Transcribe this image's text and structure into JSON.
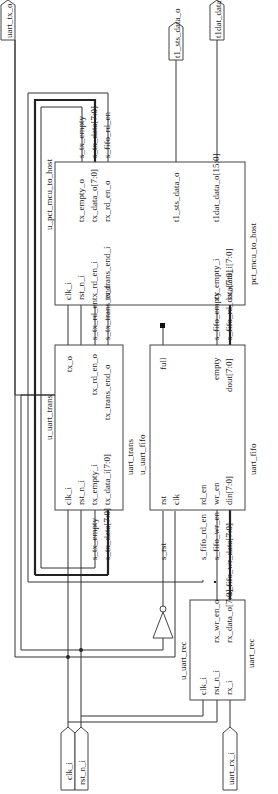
{
  "ports": {
    "clk_i": "clk_i",
    "rst_n_i": "rst_n_i",
    "uart_rx_i": "uart_rx_i",
    "uart_tx_o": "uart_tx_o",
    "t1_sts_data_o": "t1_sts_data_o",
    "t1dat_data_o": "t1dat_data_o[15:0]"
  },
  "blocks": {
    "mcu": {
      "inst": "u_pct_mcu_to_host",
      "type": "pct_mcu_to_host",
      "in": [
        "clk_i",
        "rst_n_i",
        "tx_rd_en_i",
        "tx_trans_end_i",
        "rx_empty_i",
        "rx_data_i[7:0]"
      ],
      "out": [
        "tx_empty_o",
        "tx_data_o[7:0]",
        "rx_rd_en_o",
        "t1_sts_data_o",
        "t1dat_data_o[15:0]"
      ]
    },
    "trans": {
      "inst": "u_uart_trans",
      "type": "uart_trans",
      "in": [
        "clk_i",
        "rst_n_i",
        "tx_empty_i",
        "tx_data_i[7:0]"
      ],
      "out": [
        "tx_o",
        "tx_rd_en_o",
        "tx_trans_end_o"
      ]
    },
    "fifo": {
      "inst": "u_uart_fifo",
      "type": "uart_fifo",
      "in": [
        "rst",
        "clk",
        "rd_en",
        "wr_en",
        "din[7:0]"
      ],
      "out": [
        "full",
        "empty",
        "dout[7:0]"
      ]
    },
    "rec": {
      "inst": "u_uart_rec",
      "type": "uart_rec",
      "in": [
        "clk_i",
        "rst_n_i",
        "rx_i"
      ],
      "out": [
        "rx_wr_en_o",
        "rx_data_o[7:0]"
      ]
    }
  },
  "nets": {
    "s_tx_empty": "s_tx_empty",
    "s_tx_data": "s_tx_data[7:0]",
    "s_fifo_rd_en": "s_fifo_rd_en",
    "s_tx_rd_en": "s_tx_rd_en",
    "s_tx_trans_end": "s_tx_trans_end",
    "s_fifo_empty": "s_fifo_empty",
    "s_fifo_rd_data": "s_fifo_rd_data[7:0]",
    "s_rst": "s_rst",
    "s_fifo_wr_en": "s_fifo_wr_en",
    "s_fifo_wr_data": "s_fifo_wr_data[7:0]"
  }
}
